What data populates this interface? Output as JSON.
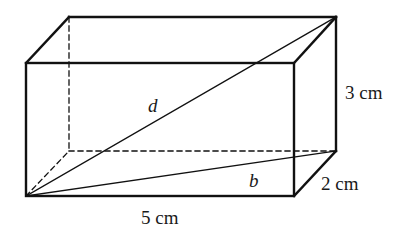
{
  "diagram": {
    "type": "rectangular-prism",
    "labels": {
      "diagonal": "d",
      "base_diagonal": "b",
      "height": "3 cm",
      "depth": "2 cm",
      "length": "5 cm"
    },
    "vertices": {
      "front_top_left": [
        26,
        63
      ],
      "front_top_right": [
        294,
        63
      ],
      "front_bottom_left": [
        26,
        196
      ],
      "front_bottom_right": [
        294,
        196
      ],
      "back_top_left": [
        69,
        17
      ],
      "back_top_right": [
        336,
        17
      ],
      "back_bottom_left": [
        69,
        151
      ],
      "back_bottom_right": [
        336,
        151
      ]
    },
    "colors": {
      "stroke": "#111111",
      "background": "#ffffff"
    }
  }
}
